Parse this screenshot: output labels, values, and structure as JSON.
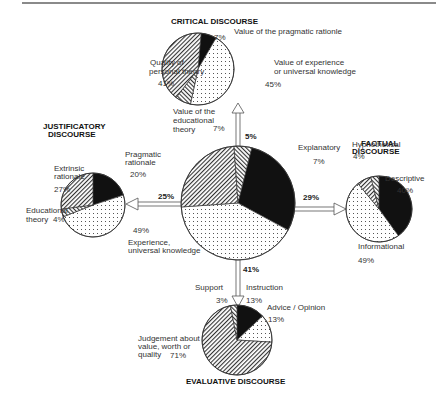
{
  "diagram": {
    "center": {
      "name": "Discourse types",
      "slices": [
        {
          "label": "Factual discourse",
          "value": 29,
          "fill": "black"
        },
        {
          "label": "Evaluative discourse",
          "value": 41,
          "fill": "dots"
        },
        {
          "label": "Justificatory discourse",
          "value": 25,
          "fill": "hatch"
        },
        {
          "label": "Critical discourse",
          "value": 5,
          "fill": "hatch2"
        }
      ]
    },
    "arrows": {
      "critical": "5%",
      "justificatory": "25%",
      "factual": "29%",
      "evaluative": "41%"
    },
    "critical": {
      "title": "CRITICAL DISCOURSE",
      "slices": [
        {
          "label": "Value of the pragmatic rationle",
          "value": 7,
          "pct": "7%",
          "fill": "black"
        },
        {
          "label": "Value of experience or universal knowledge",
          "line1": "Value of experience",
          "line2": "or universal knowledge",
          "value": 45,
          "pct": "45%",
          "fill": "dots"
        },
        {
          "label": "Value of the educational theory",
          "line1": "Value of the",
          "line2": "educational",
          "line3": "theory",
          "value": 7,
          "pct": "7%",
          "fill": "hatch2"
        },
        {
          "label": "Quality of personal theory",
          "line1": "Quality of",
          "line2": "personal theory",
          "value": 41,
          "pct": "41%",
          "fill": "hatch"
        }
      ]
    },
    "justificatory": {
      "title_line1": "JUSTIFICATORY",
      "title_line2": "DISCOURSE",
      "slices": [
        {
          "label": "Pragmatic rationale",
          "line1": "Pragmatic",
          "line2": "rationale",
          "value": 20,
          "pct": "20%",
          "fill": "black"
        },
        {
          "label": "Experience, universal knowledge",
          "line1": "Experience,",
          "line2": "universal knowledge",
          "value": 49,
          "pct": "49%",
          "fill": "dots"
        },
        {
          "label": "Educational theory",
          "line1": "Educational",
          "line2": "theory",
          "value": 4,
          "pct": "4%",
          "fill": "hatch2"
        },
        {
          "label": "Extrinsic rationale",
          "line1": "Extrinsic",
          "line2": "rationale",
          "value": 27,
          "pct": "27%",
          "fill": "hatch"
        }
      ]
    },
    "factual": {
      "title_line1": "FACTUAL",
      "title_line2": "DISCOURSE",
      "slices": [
        {
          "label": "Descriptive",
          "value": 40,
          "pct": "40%",
          "fill": "black"
        },
        {
          "label": "Informational",
          "value": 49,
          "pct": "49%",
          "fill": "dots"
        },
        {
          "label": "Explanatory",
          "value": 7,
          "pct": "7%",
          "fill": "hatch"
        },
        {
          "label": "Hyphothetical",
          "value": 4,
          "pct": "4%",
          "fill": "hatch2"
        }
      ]
    },
    "evaluative": {
      "title": "EVALUATIVE DISCOURSE",
      "slices": [
        {
          "label": "Instruction",
          "value": 13,
          "pct": "13%",
          "fill": "black"
        },
        {
          "label": "Advice / Opinion",
          "value": 13,
          "pct": "13%",
          "fill": "dots"
        },
        {
          "label": "Judgement about value, worth or quality",
          "line1": "Judgement about",
          "line2": "value, worth or",
          "line3": "quality",
          "value": 71,
          "pct": "71%",
          "fill": "hatch"
        },
        {
          "label": "Support",
          "value": 3,
          "pct": "3%",
          "fill": "hatch2"
        }
      ]
    }
  }
}
